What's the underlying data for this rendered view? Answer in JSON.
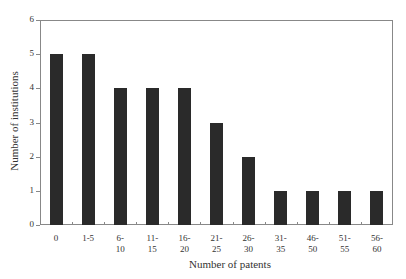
{
  "chart_data": {
    "type": "bar",
    "title": "",
    "xlabel": "Number of patents",
    "ylabel": "Number of institutions",
    "categories": [
      "0",
      "1-5",
      "6-\n10",
      "11-\n15",
      "16-\n20",
      "21-\n25",
      "26-\n30",
      "31-\n35",
      "46-\n50",
      "51-\n55",
      "56-\n60"
    ],
    "values": [
      5,
      5,
      4,
      4,
      4,
      3,
      2,
      1,
      1,
      1,
      1
    ],
    "ylim": [
      0,
      6
    ],
    "yticks": [
      0,
      1,
      2,
      3,
      4,
      5,
      6
    ],
    "grid": false,
    "legend": null,
    "bar_color": "#2a2a2a"
  }
}
